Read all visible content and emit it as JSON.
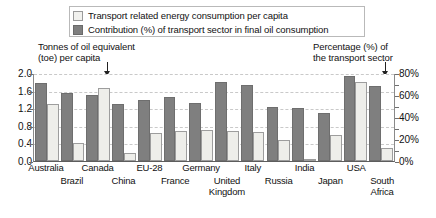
{
  "legend": {
    "items": [
      {
        "label": "Transport related energy consumption per capita",
        "swatch": "light",
        "color": "#eeeeea"
      },
      {
        "label": "Contribution (%) of transport sector in final oil consumption",
        "swatch": "dark",
        "color": "#7f7f7f"
      }
    ]
  },
  "captions": {
    "left": "Tonnes of oil equivalent (toe) per capita",
    "left_line1": "Tonnes of oil equivalent",
    "left_line2": "(toe) per capita",
    "right": "Percentage (%) of the transport sector",
    "right_line1": "Percentage (%) of",
    "right_line2": "the transport sector"
  },
  "axes": {
    "left_ticks": [
      "2.0",
      "1.6",
      "1.2",
      "0.8",
      "0.4",
      "0.0"
    ],
    "right_ticks": [
      "80%",
      "60%",
      "40%",
      "20%",
      "0%"
    ]
  },
  "annotations": [
    {
      "name": "left-axis-pointer",
      "target": "Canada light bar"
    },
    {
      "name": "right-axis-pointer",
      "target": "South Africa dark bar"
    }
  ],
  "chart_data": {
    "type": "bar",
    "title": "",
    "xlabel": "",
    "ylabel": "Tonnes of oil equivalent (toe) per capita",
    "y2label": "Percentage (%) of the transport sector",
    "ylim": [
      0,
      2.0
    ],
    "y2lim": [
      0,
      80
    ],
    "grid": true,
    "legend_position": "top",
    "categories": [
      "Australia",
      "Brazil",
      "Canada",
      "China",
      "EU-28",
      "France",
      "Germany",
      "United Kingdom",
      "Italy",
      "Russia",
      "India",
      "Japan",
      "USA",
      "South Africa"
    ],
    "series": [
      {
        "name": "Contribution (%) of transport sector in final oil consumption",
        "axis": "right",
        "unit": "%",
        "color": "#7f7f7f",
        "values": [
          72,
          63,
          61,
          52,
          56,
          59,
          53,
          73,
          70,
          50,
          49,
          44,
          78,
          69
        ]
      },
      {
        "name": "Transport related energy consumption per capita",
        "axis": "left",
        "unit": "toe",
        "color": "#eeeeea",
        "values": [
          1.31,
          0.41,
          1.69,
          0.18,
          0.65,
          0.7,
          0.72,
          0.7,
          0.66,
          0.48,
          0.05,
          0.6,
          1.82,
          0.31
        ]
      }
    ]
  }
}
